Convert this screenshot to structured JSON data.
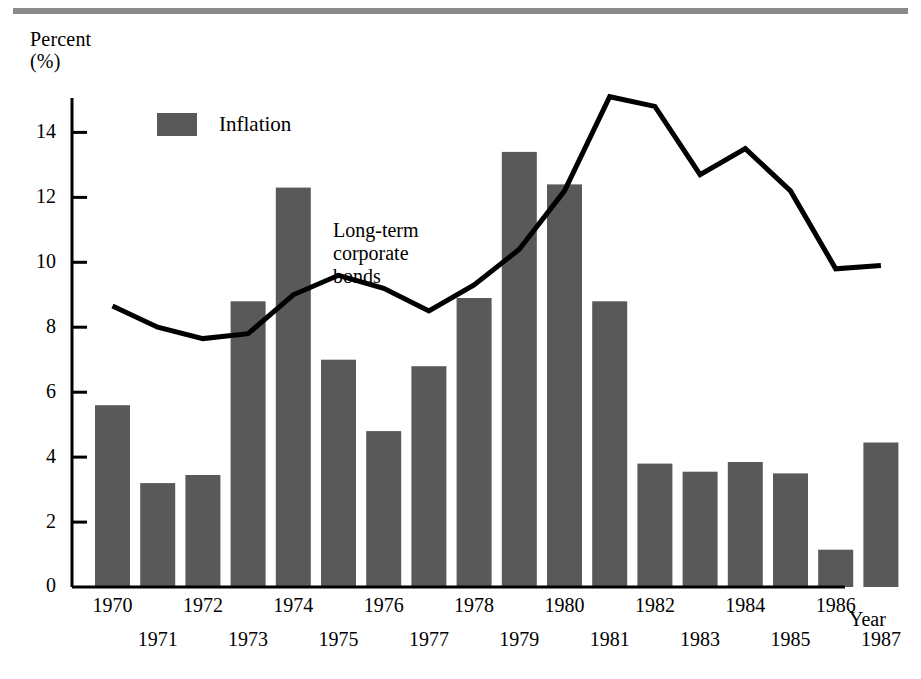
{
  "chart_data": {
    "type": "bar",
    "title": "",
    "xlabel": "Year",
    "ylabel": "Percent\n(%)",
    "ylim": [
      0,
      15.8
    ],
    "yticks": [
      0,
      2,
      4,
      6,
      8,
      10,
      12,
      14
    ],
    "grid": false,
    "legend_position": "top-left",
    "annotations": [
      {
        "text": "Long-term\ncorporate\nbonds",
        "target_series": "Long-term corporate bonds"
      }
    ],
    "categories": [
      "1970",
      "1971",
      "1972",
      "1973",
      "1974",
      "1975",
      "1976",
      "1977",
      "1978",
      "1979",
      "1980",
      "1981",
      "1982",
      "1983",
      "1984",
      "1985",
      "1986",
      "1987"
    ],
    "series": [
      {
        "name": "Inflation",
        "kind": "bar",
        "color": "#595959",
        "values": [
          5.6,
          3.2,
          3.45,
          8.8,
          12.3,
          7.0,
          4.8,
          6.8,
          8.9,
          13.4,
          12.4,
          8.8,
          3.8,
          3.55,
          3.85,
          3.5,
          1.15,
          4.45
        ]
      },
      {
        "name": "Long-term corporate bonds",
        "kind": "line",
        "color": "#000000",
        "values": [
          8.65,
          8.0,
          7.65,
          7.8,
          9.0,
          9.6,
          9.2,
          8.5,
          9.3,
          10.4,
          12.2,
          15.1,
          14.8,
          12.7,
          13.5,
          12.2,
          9.8,
          9.9
        ]
      }
    ]
  },
  "axes": {
    "y_label_line1": "Percent",
    "y_label_line2": "(%)",
    "x_label": "Year",
    "y_tick_labels": [
      "14",
      "12",
      "10",
      "8",
      "6",
      "4",
      "2",
      "0"
    ]
  },
  "legend": {
    "inflation_label": "Inflation"
  },
  "annotation": {
    "bonds_line1": "Long-term",
    "bonds_line2": "corporate",
    "bonds_line3": "bonds"
  },
  "colors": {
    "bar_fill": "#595959",
    "line_stroke": "#000000",
    "axis": "#000000",
    "top_rule": "#8a8a8a"
  }
}
